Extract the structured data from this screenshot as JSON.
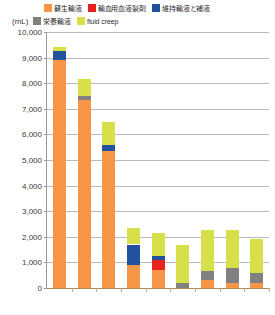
{
  "chart_data": {
    "type": "bar",
    "subtype": "stacked-column",
    "title": "",
    "xlabel": "",
    "ylabel": "(mL)",
    "ylim": [
      0,
      10000
    ],
    "ytick_step": 1000,
    "ytick_labels": [
      "10,000",
      "9,000",
      "8,000",
      "7,000",
      "6,000",
      "5,000",
      "4,000",
      "3,000",
      "2,000",
      "1,000",
      "0"
    ],
    "ytick_values": [
      10000,
      9000,
      8000,
      7000,
      6000,
      5000,
      4000,
      3000,
      2000,
      1000,
      0
    ],
    "grid": true,
    "grid_axis": "y",
    "legend_position": "top",
    "categories": [
      "1",
      "2",
      "3",
      "4",
      "5",
      "6",
      "7",
      "8",
      "9"
    ],
    "category_labels_visible": false,
    "series": [
      {
        "name": "蘇生輸液",
        "color": "#F79646",
        "values": [
          8900,
          7350,
          5350,
          900,
          700,
          0,
          300,
          200,
          200
        ]
      },
      {
        "name": "輸血用血液製剤",
        "color": "#E8211C",
        "values": [
          0,
          0,
          0,
          0,
          400,
          0,
          0,
          0,
          0
        ]
      },
      {
        "name": "維持輸液と補液",
        "color": "#23539E",
        "values": [
          350,
          0,
          250,
          800,
          150,
          0,
          0,
          0,
          0
        ]
      },
      {
        "name": "栄養輸液",
        "color": "#808080",
        "values": [
          0,
          150,
          0,
          0,
          0,
          200,
          350,
          600,
          400
        ]
      },
      {
        "name": "fluid creep",
        "color": "#D7E04A",
        "values": [
          150,
          650,
          900,
          650,
          900,
          1500,
          1600,
          1450,
          1300
        ]
      }
    ],
    "totals": [
      9400,
      8150,
      6500,
      2350,
      2150,
      1700,
      2250,
      2250,
      1900
    ]
  },
  "legend": {
    "unit_label": "(mL)",
    "items": [
      {
        "label": "蘇生輸液",
        "color": "#F79646",
        "row": 1
      },
      {
        "label": "輸血用血液製剤",
        "color": "#E8211C",
        "row": 1
      },
      {
        "label": "維持輸液と補液",
        "color": "#23539E",
        "row": 1
      },
      {
        "label": "栄養輸液",
        "color": "#808080",
        "row": 2
      },
      {
        "label": "fluid creep",
        "color": "#D7E04A",
        "row": 2
      }
    ]
  },
  "colors": {
    "gridline": "#b9b9b9",
    "axis": "#9a9a9a",
    "baseline": "#b08a5a",
    "background": "#ffffff",
    "text": "#3a3a3a"
  }
}
